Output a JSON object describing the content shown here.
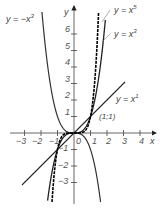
{
  "chart_data": {
    "type": "line",
    "title": "",
    "xlabel": "x",
    "ylabel": "y",
    "xlim": [
      -3.5,
      4.7
    ],
    "ylim": [
      -4.2,
      7.7
    ],
    "grid": false,
    "x_ticks": [
      "-3",
      "-2",
      "-1",
      "1",
      "2",
      "3",
      "4"
    ],
    "y_ticks": [
      "6",
      "5",
      "4",
      "3",
      "2",
      "1",
      "-1",
      "-2",
      "-3"
    ],
    "origin_label": "0",
    "series": [
      {
        "name": "y = x^5",
        "label_base": "y = x",
        "label_exp": "5",
        "exponent": 5,
        "sign": 1,
        "style": "dashed-dark"
      },
      {
        "name": "y = x^3",
        "label_base": "y = x",
        "label_exp": "3",
        "exponent": 3,
        "sign": 1,
        "style": "solid"
      },
      {
        "name": "y = x^1",
        "label_base": "y = x",
        "label_exp": "1",
        "exponent": 1,
        "sign": 1,
        "style": "solid"
      },
      {
        "name": "y = -x^3",
        "label_base": "y = −x",
        "label_exp": "3",
        "exponent": 3,
        "sign": -1,
        "style": "solid"
      }
    ],
    "annotations": [
      {
        "text": "(1;1)",
        "x": 1,
        "y": 1
      }
    ]
  },
  "labels": {
    "x5_base": "y = x",
    "x5_exp": "5",
    "x3_base": "y = x",
    "x3_exp": "3",
    "x1_base": "y = x",
    "x1_exp": "1",
    "negx3_base": "y = −x",
    "negx3_exp": "3",
    "point": "(1;1)",
    "x_axis": "x",
    "y_axis": "y",
    "origin": "0"
  },
  "ticks": {
    "x": {
      "m3": "−3",
      "m2": "−2",
      "m1": "−1",
      "p1": "1",
      "p2": "2",
      "p3": "3",
      "p4": "4"
    },
    "y": {
      "p6": "6",
      "p5": "5",
      "p4": "4",
      "p3": "3",
      "p2": "2",
      "p1": "1",
      "m1": "−1",
      "m2": "−2",
      "m3": "−3"
    }
  }
}
